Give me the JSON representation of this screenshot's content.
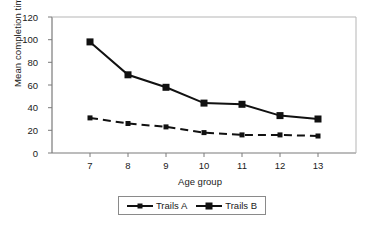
{
  "chart_data": {
    "type": "line",
    "title": "",
    "subtitle": "",
    "xlabel": "Age group",
    "ylabel": "Mean completion time",
    "categories": [
      "7",
      "8",
      "9",
      "10",
      "11",
      "12",
      "13"
    ],
    "x": [
      7,
      8,
      9,
      10,
      11,
      12,
      13
    ],
    "xlim": [
      6.5,
      13.5
    ],
    "ylim": [
      0,
      120
    ],
    "yticks": [
      0,
      20,
      40,
      60,
      80,
      100,
      120
    ],
    "ytick_labels": [
      "0",
      "20",
      "40",
      "60",
      "80",
      "100",
      "120"
    ],
    "xtick_labels": [
      "7",
      "8",
      "9",
      "10",
      "11",
      "12",
      "13"
    ],
    "grid": false,
    "legend_position": "bottom-center",
    "series": [
      {
        "name": "Trails A",
        "values": [
          31,
          26,
          23,
          18,
          16,
          16,
          15
        ],
        "line_style": "dashed",
        "marker": "square-small",
        "color": "#111111"
      },
      {
        "name": "Trails B",
        "values": [
          98,
          69,
          58,
          44,
          43,
          33,
          30
        ],
        "line_style": "solid",
        "marker": "square",
        "color": "#111111"
      }
    ],
    "annotations": []
  },
  "legend": {
    "items": [
      {
        "label": "Trails A"
      },
      {
        "label": "Trails B"
      }
    ]
  },
  "colors": {
    "axis": "#7a7a7a",
    "series": "#111111",
    "legend_border": "#8a8a8a",
    "background": "#ffffff",
    "text": "#1a1a1a"
  }
}
